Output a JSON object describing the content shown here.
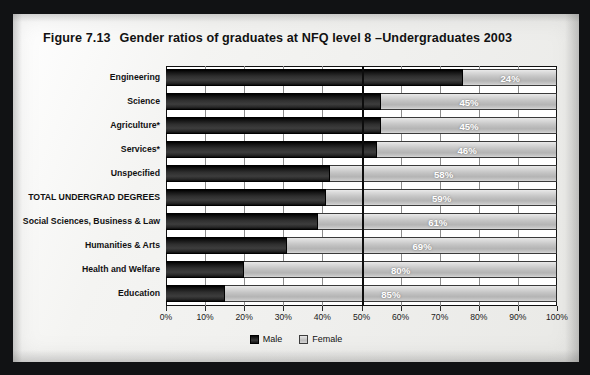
{
  "figure": {
    "number": "Figure 7.13",
    "title": "Gender ratios of graduates at NFQ level 8 –Undergraduates 2003"
  },
  "legend": {
    "male_label": "Male",
    "female_label": "Female"
  },
  "colors": {
    "male": "#2a2a2a",
    "female": "#c4c4c4",
    "axis": "#101010",
    "midline": "#0d0d0d",
    "page": "#f2f2f0",
    "frame": "#111214"
  },
  "chart_data": {
    "type": "bar",
    "orientation": "horizontal",
    "stacked": true,
    "stacked_100pct": true,
    "xlabel": "",
    "ylabel": "",
    "xlim": [
      0,
      100
    ],
    "xticks": [
      0,
      10,
      20,
      30,
      40,
      50,
      60,
      70,
      80,
      90,
      100
    ],
    "xtick_labels": [
      "0%",
      "10%",
      "20%",
      "30%",
      "40%",
      "50%",
      "60%",
      "70%",
      "80%",
      "90%",
      "100%"
    ],
    "grid": true,
    "reference_line": 50,
    "legend_position": "bottom-center",
    "value_label_series": "Female",
    "categories": [
      "Engineering",
      "Science",
      "Agriculture*",
      "Services*",
      "Unspecified",
      "TOTAL UNDERGRAD DEGREES",
      "Social Sciences, Business & Law",
      "Humanities & Arts",
      "Health and Welfare",
      "Education"
    ],
    "series": [
      {
        "name": "Male",
        "values": [
          76,
          55,
          55,
          54,
          42,
          41,
          39,
          31,
          20,
          15
        ]
      },
      {
        "name": "Female",
        "values": [
          24,
          45,
          45,
          46,
          58,
          59,
          61,
          69,
          80,
          85
        ]
      }
    ],
    "data_labels": [
      "24%",
      "45%",
      "45%",
      "46%",
      "58%",
      "59%",
      "61%",
      "69%",
      "80%",
      "85%"
    ]
  }
}
